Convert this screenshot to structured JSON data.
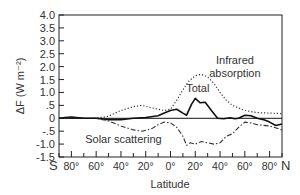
{
  "chart_data": {
    "type": "line",
    "title": "",
    "xlabel": "Latitude",
    "ylabel": "ΔF (W m⁻²)",
    "ylim": [
      -1.5,
      4.0
    ],
    "xlim": [
      -90,
      90
    ],
    "grid": false,
    "legend": "inline annotations",
    "yticks": [
      {
        "value": 4.0,
        "label": "4.0"
      },
      {
        "value": 3.5,
        "label": "3.5"
      },
      {
        "value": 3.0,
        "label": "3.0"
      },
      {
        "value": 2.5,
        "label": "2.5"
      },
      {
        "value": 2.0,
        "label": "2.0"
      },
      {
        "value": 1.5,
        "label": "1.5"
      },
      {
        "value": 1.0,
        "label": "1.0"
      },
      {
        "value": 0.5,
        "label": ".5"
      },
      {
        "value": 0,
        "label": "0"
      },
      {
        "value": -0.5,
        "label": "-.5"
      },
      {
        "value": -1.0,
        "label": "-1.0"
      },
      {
        "value": -1.5,
        "label": "-1.5"
      }
    ],
    "xticks": [
      {
        "value": -80,
        "label": "80°"
      },
      {
        "value": -60,
        "label": "60°"
      },
      {
        "value": -40,
        "label": "40°"
      },
      {
        "value": -20,
        "label": "20°"
      },
      {
        "value": 0,
        "label": "0°"
      },
      {
        "value": 20,
        "label": "20°"
      },
      {
        "value": 40,
        "label": "40°"
      },
      {
        "value": 60,
        "label": "60°"
      },
      {
        "value": 80,
        "label": "80°"
      }
    ],
    "x_end_labels": {
      "south": "S",
      "north": "N"
    },
    "series": [
      {
        "name": "Infrared absorption",
        "style": "dotted",
        "x": [
          -90,
          -80,
          -70,
          -60,
          -50,
          -40,
          -30,
          -23,
          -15,
          -5,
          0,
          5,
          10,
          15,
          20,
          25,
          30,
          35,
          40,
          45,
          50,
          60,
          70,
          80,
          90
        ],
        "values": [
          0.0,
          0.02,
          0.0,
          0.0,
          0.08,
          0.3,
          0.45,
          0.5,
          0.4,
          0.3,
          0.35,
          0.7,
          1.1,
          1.45,
          1.65,
          1.7,
          1.6,
          1.35,
          1.0,
          0.7,
          0.5,
          0.3,
          0.22,
          0.2,
          0.18
        ]
      },
      {
        "name": "Total",
        "style": "solid",
        "x": [
          -90,
          -85,
          -80,
          -70,
          -60,
          -50,
          -40,
          -30,
          -20,
          -10,
          -5,
          0,
          5,
          10,
          13,
          17,
          20,
          24,
          28,
          33,
          38,
          43,
          48,
          52,
          55,
          60,
          65,
          70,
          75,
          80,
          85,
          90
        ],
        "values": [
          0.0,
          0.03,
          0.05,
          0.0,
          0.0,
          -0.05,
          -0.05,
          0.0,
          0.03,
          0.1,
          0.2,
          0.3,
          0.35,
          0.2,
          0.12,
          0.55,
          0.77,
          0.6,
          0.62,
          0.3,
          0.0,
          -0.02,
          0.02,
          -0.02,
          0.0,
          0.12,
          0.1,
          0.0,
          -0.05,
          -0.15,
          -0.28,
          -0.22
        ]
      },
      {
        "name": "Solar scattering",
        "style": "dash-dot",
        "x": [
          -90,
          -80,
          -70,
          -60,
          -55,
          -50,
          -40,
          -30,
          -23,
          -15,
          -10,
          -5,
          0,
          5,
          10,
          13,
          16,
          20,
          25,
          30,
          35,
          40,
          45,
          50,
          55,
          60,
          65,
          70,
          80,
          90
        ],
        "values": [
          0.0,
          0.0,
          0.0,
          0.0,
          -0.05,
          -0.1,
          -0.3,
          -0.45,
          -0.5,
          -0.4,
          -0.25,
          -0.15,
          -0.18,
          -0.35,
          -0.7,
          -1.05,
          -0.95,
          -1.0,
          -0.9,
          -0.95,
          -1.0,
          -0.95,
          -0.7,
          -0.6,
          -0.35,
          -0.15,
          -0.18,
          -0.25,
          -0.3,
          -0.45
        ]
      },
      {
        "name": "Zero line",
        "style": "solid-thin",
        "x": [
          -90,
          90
        ],
        "values": [
          0,
          0
        ]
      }
    ],
    "annotations": [
      {
        "text": "Infrared",
        "x": 52,
        "y": 2.1
      },
      {
        "text": "absorption",
        "x": 52,
        "y": 1.6
      },
      {
        "text": "Total",
        "x": 22,
        "y": 1.0
      },
      {
        "text": "Solar scattering",
        "x": -38,
        "y": -0.95
      }
    ]
  }
}
